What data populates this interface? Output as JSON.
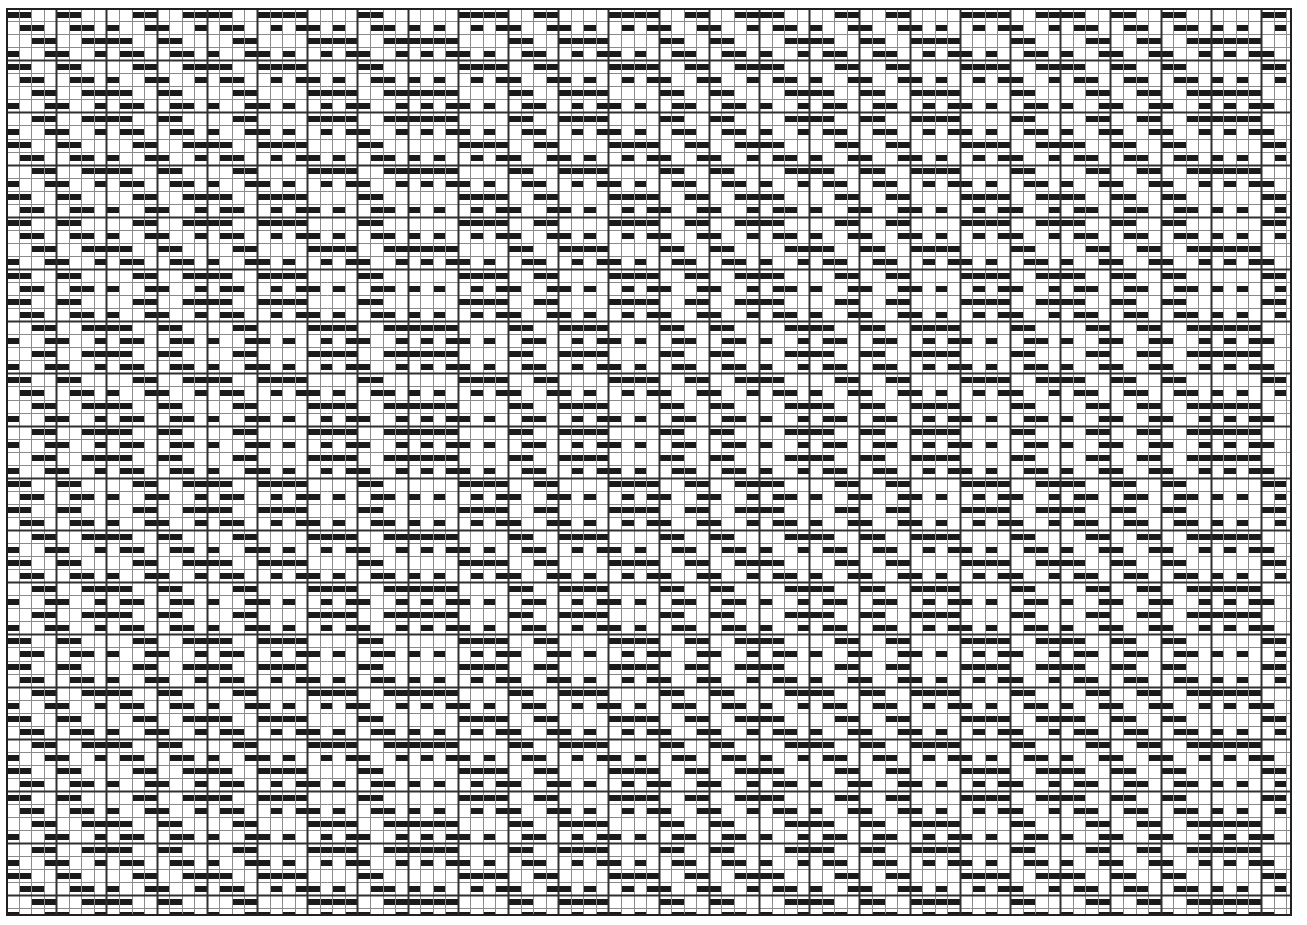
{
  "document": {
    "kind": "weaving-drawdown",
    "title": "Overshot Weaving Drawdown",
    "description": "Monochrome overshot weave drawdown grid of filled and empty cells forming diamond and cross motifs"
  },
  "chart_data": {
    "type": "heatmap",
    "xlabel": "Warp ends (columns)",
    "ylabel": "Weft picks (rows)",
    "grid": true,
    "legend": null,
    "columns": 102,
    "rows": 70,
    "cell_width": 12.55,
    "cell_height": 13.05,
    "mark_height_ratio": 0.46,
    "group_every": 4,
    "colors": {
      "fill": "#1a1a1a",
      "background": "#ffffff",
      "gridline_thin": "#8a8a8a",
      "gridline_thick": "#303030",
      "border": "#202020"
    },
    "gridline_thin_width": 1,
    "gridline_thick_width": 2,
    "border_width": 2,
    "threading_shafts": 4,
    "threading_label": "Threading (warp order by shaft 1-4)",
    "threading": [
      1,
      2,
      3,
      4,
      1,
      2,
      3,
      4,
      3,
      4,
      1,
      2,
      3,
      4,
      1,
      2,
      1,
      2,
      3,
      4,
      1,
      2,
      1,
      2,
      3,
      4,
      3,
      4,
      1,
      2,
      3,
      4,
      3,
      4,
      3,
      4,
      1,
      2,
      1,
      2,
      3,
      4,
      1,
      2,
      3,
      4,
      3,
      4,
      1,
      2,
      1,
      2,
      3,
      4,
      1,
      2,
      3,
      4,
      1,
      2,
      1,
      2,
      3,
      4,
      3,
      4,
      1,
      2,
      3,
      4,
      1,
      2,
      3,
      4,
      3,
      4,
      1,
      2,
      1,
      2,
      3,
      4,
      1,
      2,
      1,
      2,
      3,
      4,
      1,
      2,
      3,
      4,
      1,
      2,
      3,
      4,
      3,
      4,
      3,
      4,
      1,
      2
    ],
    "treadling_label": "Treadling (weft order by treadle 1-4)",
    "treadling": [
      1,
      2,
      3,
      4,
      1,
      2,
      3,
      4,
      3,
      4,
      1,
      2,
      3,
      4,
      1,
      2,
      1,
      2,
      3,
      4,
      1,
      2,
      1,
      2,
      3,
      4,
      3,
      4,
      1,
      2,
      3,
      4,
      3,
      4,
      3,
      4,
      1,
      2,
      1,
      2,
      3,
      4,
      1,
      2,
      3,
      4,
      3,
      4,
      1,
      2,
      1,
      2,
      3,
      4,
      1,
      2,
      3,
      4,
      1,
      2,
      1,
      2,
      3,
      4,
      3,
      4,
      1,
      2,
      3,
      4
    ],
    "tieup_label": "Tie-up (treadle x shaft)",
    "tieup": [
      [
        1,
        1,
        0,
        0
      ],
      [
        0,
        1,
        1,
        0
      ],
      [
        0,
        0,
        1,
        1
      ],
      [
        1,
        0,
        0,
        1
      ]
    ],
    "weave_structure": "overshot / 4-shaft twill-based"
  }
}
